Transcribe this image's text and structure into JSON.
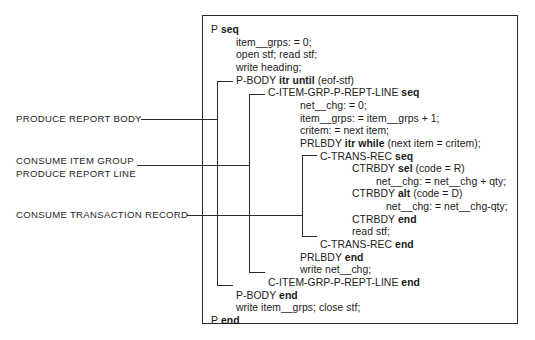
{
  "annotations": [
    {
      "id": "produce-report-body",
      "lines": [
        "PRODUCE REPORT BODY"
      ]
    },
    {
      "id": "consume-item-group",
      "lines": [
        "CONSUME ITEM GROUP",
        "PRODUCE REPORT LINE"
      ]
    },
    {
      "id": "consume-transaction-record",
      "lines": [
        "CONSUME TRANSACTION RECORD"
      ]
    }
  ],
  "code": [
    {
      "indent": 0,
      "name": "P",
      "kw": "seq",
      "rest": ""
    },
    {
      "indent": 1,
      "name": "item__grps: = 0;",
      "kw": "",
      "rest": ""
    },
    {
      "indent": 1,
      "name": "open stf; read stf;",
      "kw": "",
      "rest": ""
    },
    {
      "indent": 1,
      "name": "write heading;",
      "kw": "",
      "rest": ""
    },
    {
      "indent": 1,
      "name": "P-BODY",
      "kw": "itr until",
      "rest": "(eof-stf)"
    },
    {
      "indent": 2,
      "name": "C-ITEM-GRP-P-REPT-LINE",
      "kw": "seq",
      "rest": ""
    },
    {
      "indent": 3,
      "name": "net__chg: = 0;",
      "kw": "",
      "rest": ""
    },
    {
      "indent": 3,
      "name": "item__grps: = item__grps + 1;",
      "kw": "",
      "rest": ""
    },
    {
      "indent": 3,
      "name": "critem: = next item;",
      "kw": "",
      "rest": ""
    },
    {
      "indent": 3,
      "name": "PRLBDY",
      "kw": "itr while",
      "rest": "(next item = critem);"
    },
    {
      "indent": 4,
      "name": "C-TRANS-REC",
      "kw": "seq",
      "rest": ""
    },
    {
      "indent": 5,
      "name": "CTRBDY",
      "kw": "sel",
      "rest": "(code = R)"
    },
    {
      "indent": 6,
      "name": "net__chg: = net__chg + qty;",
      "kw": "",
      "rest": ""
    },
    {
      "indent": 5,
      "name": "CTRBDY",
      "kw": "alt",
      "rest": "(code = D)"
    },
    {
      "indent": 7,
      "name": "net__chg: = net__chg-qty;",
      "kw": "",
      "rest": ""
    },
    {
      "indent": 5,
      "name": "CTRBDY",
      "kw": "end",
      "rest": ""
    },
    {
      "indent": 5,
      "name": "read stf;",
      "kw": "",
      "rest": ""
    },
    {
      "indent": 4,
      "name": "C-TRANS-REC",
      "kw": "end",
      "rest": ""
    },
    {
      "indent": 3,
      "name": "PRLBDY",
      "kw": "end",
      "rest": ""
    },
    {
      "indent": 3,
      "name": "write net__chg;",
      "kw": "",
      "rest": ""
    },
    {
      "indent": 2,
      "name": "C-ITEM-GRP-P-REPT-LINE",
      "kw": "end",
      "rest": ""
    },
    {
      "indent": 1,
      "name": "P-BODY",
      "kw": "end",
      "rest": ""
    },
    {
      "indent": 1,
      "name": "write item__grps; close stf;",
      "kw": "",
      "rest": ""
    },
    {
      "indent": 0,
      "name": "P",
      "kw": "end",
      "rest": ""
    }
  ],
  "colors": {
    "ink": "#1a1a1a",
    "background": "#ffffff"
  }
}
